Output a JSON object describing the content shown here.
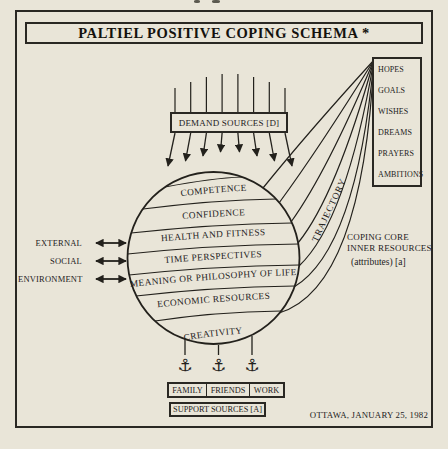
{
  "title": "PALTIEL POSITIVE COPING SCHEMA *",
  "demand": {
    "label": "DEMAND SOURCES [D]"
  },
  "sphere": {
    "bands": [
      "COMPETENCE",
      "CONFIDENCE",
      "HEALTH AND FITNESS",
      "TIME PERSPECTIVES",
      "MEANING OR PHILOSOPHY OF LIFE",
      "ECONOMIC RESOURCES",
      "CREATIVITY"
    ]
  },
  "left_factors": {
    "items": [
      "EXTERNAL",
      "SOCIAL",
      "ENVIRONMENT"
    ]
  },
  "trajectory_label": "TRAJECTORY",
  "inner_resources": {
    "items": [
      "HOPES",
      "GOALS",
      "WISHES",
      "DREAMS",
      "PRAYERS",
      "AMBITIONS"
    ],
    "caption_line1": "COPING CORE",
    "caption_line2": "INNER RESOURCES",
    "caption_line3": "(attributes) [a]"
  },
  "support": {
    "cells": [
      "FAMILY",
      "FRIENDS",
      "WORK"
    ],
    "label": "SUPPORT SOURCES [A]",
    "anchor_icon": "⚓"
  },
  "footer": {
    "date_line": "OTTAWA, JANUARY 25, 1982"
  },
  "colors": {
    "paper": "#e9e5d8",
    "ink": "#23211c"
  }
}
